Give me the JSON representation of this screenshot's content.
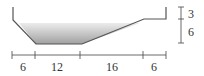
{
  "diagram": {
    "type": "channel-cross-section",
    "horizontal_dimensions": [
      "6",
      "12",
      "16",
      "6"
    ],
    "vertical_dimensions": [
      "3",
      "6"
    ],
    "colors": {
      "outline": "#555555",
      "water_top": "#e8e8e8",
      "water_bottom": "#9a9a9a"
    }
  }
}
